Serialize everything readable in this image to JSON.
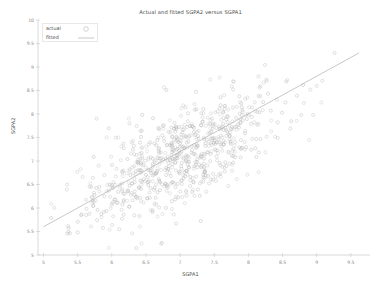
{
  "figure": {
    "width": 381,
    "height": 289,
    "background": "#ffffff"
  },
  "caption": {
    "text": ""
  },
  "legend": {
    "position": "upper-left",
    "frame": true,
    "entries": [
      {
        "label": "actual",
        "marker": "open-circle-marker",
        "color": "#b9b9b9"
      },
      {
        "label": "fitted",
        "marker": "line-swatch",
        "color": "#a9a9a9"
      }
    ]
  },
  "axes": {
    "x_label": "SGPA1",
    "y_label": "SGPA2",
    "x_ticks": [
      "5",
      "5.5",
      "6",
      "6.5",
      "7",
      "7.5",
      "8",
      "8.5",
      "9",
      "9.5"
    ],
    "y_ticks": [
      "5",
      "5.5",
      "6",
      "6.5",
      "7",
      "7.5",
      "8",
      "8.5",
      "9",
      "9.5",
      "10"
    ],
    "spine_color": "#c9c9c9",
    "tick_label_color": "#8a8a8a"
  },
  "chart_data": {
    "type": "scatter",
    "title": "Actual and fitted SGPA2 versus SGPA1",
    "xlabel": "SGPA1",
    "ylabel": "SGPA2",
    "xlim": [
      4.92,
      9.78
    ],
    "ylim": [
      5.0,
      10.0
    ],
    "xticks": [
      5,
      5.5,
      6,
      6.5,
      7,
      7.5,
      8,
      8.5,
      9,
      9.5
    ],
    "yticks": [
      5,
      5.5,
      6,
      6.5,
      7,
      7.5,
      8,
      8.5,
      9,
      9.5,
      10
    ],
    "grid": false,
    "legend_position": "upper left",
    "marker_style": "open circle",
    "marker_color": "#b5b5b5",
    "marker_size_px": 3.1,
    "series": [
      {
        "name": "actual",
        "type": "scatter",
        "n_points": 760,
        "x_mean": 6.93,
        "y_mean": 7.02,
        "x_sd": 0.72,
        "y_sd": 0.74,
        "correlation": 0.69,
        "x_range": [
          5.02,
          9.62
        ],
        "y_range": [
          5.02,
          9.72
        ]
      },
      {
        "name": "fitted",
        "type": "line",
        "color": "#a9a9a9",
        "endpoints": [
          [
            5.0,
            5.6
          ],
          [
            9.62,
            9.3
          ]
        ],
        "slope": 0.8,
        "intercept": 1.6
      }
    ]
  }
}
